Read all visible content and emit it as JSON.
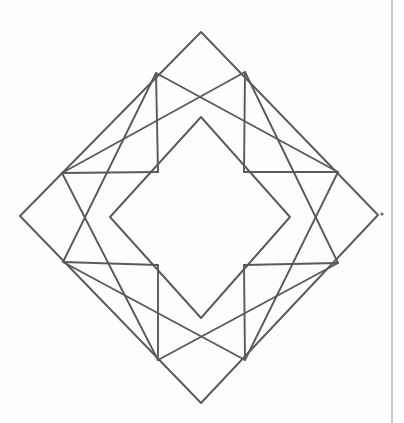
{
  "document": {
    "kind": "scanned-line-drawing",
    "title": "Geometric diamond star figure",
    "background_color": "#fdfdfb",
    "line_color": "#5a5a5c",
    "border_color": "#b8b8b4",
    "width": 404,
    "height": 423
  },
  "figure": {
    "name": "eight-point-star-in-diamond",
    "stroke_width": 1.9,
    "points": {
      "outer_top": [
        201,
        32
      ],
      "outer_right": [
        378,
        215
      ],
      "outer_bottom": [
        201,
        403
      ],
      "outer_left": [
        20,
        216
      ],
      "inner_top": [
        201,
        117
      ],
      "inner_right": [
        290,
        217
      ],
      "inner_bottom": [
        201,
        318
      ],
      "inner_left": [
        110,
        217
      ],
      "node_top_left": [
        156,
        73
      ],
      "node_top_right": [
        245,
        72
      ],
      "node_left_top": [
        62,
        173
      ],
      "node_right_top": [
        338,
        172
      ],
      "node_left_bottom": [
        63,
        262
      ],
      "node_right_bottom": [
        338,
        263
      ],
      "node_bottom_left": [
        158,
        360
      ],
      "node_bottom_right": [
        245,
        360
      ]
    },
    "shapes": [
      {
        "name": "outer-diamond",
        "type": "polygon",
        "vertices": [
          [
            201,
            32
          ],
          [
            378,
            215
          ],
          [
            201,
            403
          ],
          [
            20,
            216
          ]
        ]
      },
      {
        "name": "inner-square",
        "type": "polygon",
        "vertices": [
          [
            201,
            117
          ],
          [
            290,
            217
          ],
          [
            201,
            318
          ],
          [
            110,
            217
          ]
        ]
      },
      {
        "name": "square-a",
        "type": "polygon",
        "vertices": [
          [
            156,
            73
          ],
          [
            338,
            172
          ],
          [
            245,
            360
          ],
          [
            63,
            262
          ]
        ]
      },
      {
        "name": "square-b",
        "type": "polygon",
        "vertices": [
          [
            245,
            72
          ],
          [
            338,
            263
          ],
          [
            158,
            360
          ],
          [
            62,
            173
          ]
        ]
      },
      {
        "name": "chord-top-left",
        "type": "line",
        "vertices": [
          [
            156,
            73
          ],
          [
            158,
            172
          ]
        ]
      },
      {
        "name": "chord-top-right",
        "type": "line",
        "vertices": [
          [
            245,
            72
          ],
          [
            244,
            172
          ]
        ]
      },
      {
        "name": "chord-bottom-left",
        "type": "line",
        "vertices": [
          [
            158,
            265
          ],
          [
            158,
            360
          ]
        ]
      },
      {
        "name": "chord-bottom-right",
        "type": "line",
        "vertices": [
          [
            244,
            265
          ],
          [
            245,
            360
          ]
        ]
      },
      {
        "name": "chord-left-upper",
        "type": "line",
        "vertices": [
          [
            62,
            173
          ],
          [
            158,
            172
          ]
        ]
      },
      {
        "name": "chord-right-upper",
        "type": "line",
        "vertices": [
          [
            244,
            172
          ],
          [
            338,
            172
          ]
        ]
      },
      {
        "name": "chord-left-lower",
        "type": "line",
        "vertices": [
          [
            63,
            262
          ],
          [
            158,
            265
          ]
        ]
      },
      {
        "name": "chord-right-lower",
        "type": "line",
        "vertices": [
          [
            244,
            265
          ],
          [
            338,
            263
          ]
        ]
      }
    ]
  },
  "page_border": {
    "name": "right-margin-rule",
    "x": 392,
    "from_y": 0,
    "to_y": 423
  },
  "artifacts": [
    {
      "name": "scan-speck",
      "x": 382,
      "y": 214,
      "r": 1.6
    }
  ]
}
